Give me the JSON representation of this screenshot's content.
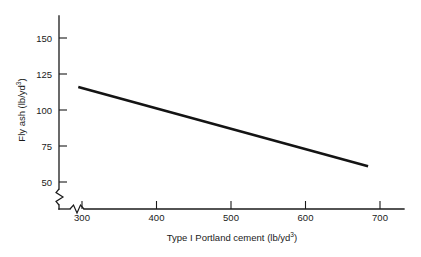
{
  "chart_data": {
    "type": "line",
    "title": "",
    "xlabel": "Type I Portland cement (lb/yd3)",
    "ylabel": "Fly ash (lb/yd3)",
    "xlabel_base": "Type I Portland cement (lb/yd",
    "xlabel_sup": "3",
    "xlabel_tail": ")",
    "ylabel_base": "Fly ash (lb/yd",
    "ylabel_sup": "3",
    "ylabel_tail": ")",
    "x_ticks": [
      300,
      400,
      500,
      600,
      700
    ],
    "x_tick_labels": [
      "300",
      "400",
      "500",
      "600",
      "700"
    ],
    "y_ticks": [
      50,
      75,
      100,
      125,
      150
    ],
    "y_tick_labels": [
      "50",
      "75",
      "100",
      "125",
      "150"
    ],
    "xlim": [
      280,
      715
    ],
    "ylim": [
      42,
      163
    ],
    "grid": false,
    "legend": null,
    "axis_break_x": true,
    "axis_break_y": true,
    "series": [
      {
        "name": "Fly ash vs cement",
        "x": [
          295,
          684
        ],
        "values": [
          116,
          61
        ],
        "color": "#141414"
      }
    ]
  }
}
